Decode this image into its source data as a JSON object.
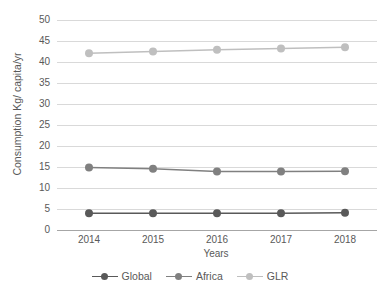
{
  "chart_data": {
    "type": "line",
    "title": "",
    "xlabel": "Years",
    "ylabel": "Consumption Kg/ capita/yr",
    "categories": [
      "2014",
      "2015",
      "2016",
      "2017",
      "2018"
    ],
    "ylim": [
      0,
      50
    ],
    "yticks": [
      0,
      5,
      10,
      15,
      20,
      25,
      30,
      35,
      40,
      45,
      50
    ],
    "grid": true,
    "legend_position": "bottom",
    "series": [
      {
        "name": "Global",
        "values": [
          4.0,
          4.0,
          4.0,
          4.0,
          4.1
        ],
        "color": "#595959"
      },
      {
        "name": "Africa",
        "values": [
          14.9,
          14.6,
          13.9,
          13.9,
          14.0
        ],
        "color": "#808080"
      },
      {
        "name": "GLR",
        "values": [
          42.1,
          42.5,
          42.9,
          43.2,
          43.5
        ],
        "color": "#bfbfbf"
      }
    ]
  }
}
